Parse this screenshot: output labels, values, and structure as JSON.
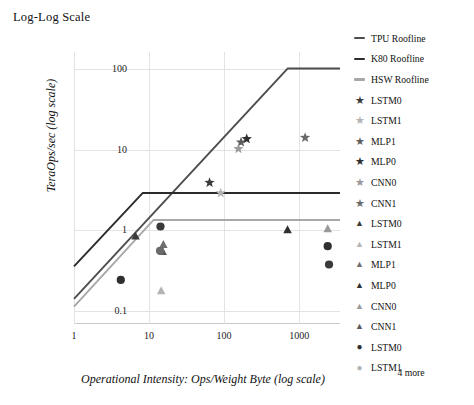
{
  "title": "Log-Log Scale",
  "legend": {
    "more_label": "4 more",
    "items": [
      {
        "label": "TPU Roofline",
        "marker": "line",
        "color": "#4d4d4d"
      },
      {
        "label": "K80 Roofline",
        "marker": "line",
        "color": "#2b2b2b"
      },
      {
        "label": "HSW Roofline",
        "marker": "line",
        "color": "#a8a8a8"
      },
      {
        "label": "LSTM0",
        "marker": "star",
        "color": "#3b3b3b"
      },
      {
        "label": "LSTM1",
        "marker": "star",
        "color": "#b4b4b4"
      },
      {
        "label": "MLP1",
        "marker": "star",
        "color": "#5e5e5e"
      },
      {
        "label": "MLP0",
        "marker": "star",
        "color": "#2f2f2f"
      },
      {
        "label": "CNN0",
        "marker": "star",
        "color": "#9a9a9a"
      },
      {
        "label": "CNN1",
        "marker": "star",
        "color": "#6b6b6b"
      },
      {
        "label": "LSTM0",
        "marker": "triangle",
        "color": "#3b3b3b"
      },
      {
        "label": "LSTM1",
        "marker": "triangle",
        "color": "#b4b4b4"
      },
      {
        "label": "MLP1",
        "marker": "triangle",
        "color": "#6f6f6f"
      },
      {
        "label": "MLP0",
        "marker": "triangle",
        "color": "#2f2f2f"
      },
      {
        "label": "CNN0",
        "marker": "triangle",
        "color": "#9a9a9a"
      },
      {
        "label": "CNN1",
        "marker": "triangle",
        "color": "#5a5a5a"
      },
      {
        "label": "LSTM0",
        "marker": "circle",
        "color": "#2f2f2f"
      },
      {
        "label": "LSTM1",
        "marker": "circle",
        "color": "#b4b4b4"
      }
    ]
  },
  "chart_data": {
    "type": "line",
    "title": "Log-Log Scale",
    "xlabel": "Operational Intensity: Ops/Weight Byte (log scale)",
    "ylabel": "TeraOps/sec (log scale)",
    "xscale": "log",
    "yscale": "log",
    "xlim": [
      1,
      3500
    ],
    "ylim": [
      0.07,
      160
    ],
    "xticks": [
      "1",
      "10",
      "100",
      "1000"
    ],
    "xtick_values": [
      1,
      10,
      100,
      1000
    ],
    "yticks": [
      "100",
      "10",
      "1",
      "0.1"
    ],
    "ytick_values": [
      100,
      10,
      1,
      0.1
    ],
    "grid": true,
    "legend_position": "right",
    "series": [
      {
        "name": "TPU Roofline",
        "color": "#4d4d4d",
        "points": [
          [
            1,
            0.143
          ],
          [
            700,
            100
          ],
          [
            3500,
            100
          ]
        ],
        "ridge_point": [
          700,
          100
        ],
        "peak": 100
      },
      {
        "name": "K80 Roofline",
        "color": "#2b2b2b",
        "points": [
          [
            1,
            0.36
          ],
          [
            8.2,
            2.9
          ],
          [
            3500,
            2.9
          ]
        ],
        "ridge_point": [
          8.2,
          2.9
        ],
        "peak": 2.9
      },
      {
        "name": "HSW Roofline",
        "color": "#a8a8a8",
        "points": [
          [
            1,
            0.115
          ],
          [
            11.5,
            1.35
          ],
          [
            3500,
            1.35
          ]
        ],
        "ridge_point": [
          11.5,
          1.35
        ],
        "peak": 1.35
      }
    ],
    "scatter": [
      {
        "name": "LSTM0",
        "marker": "star",
        "color": "#3b3b3b",
        "x": 64,
        "y": 3.9
      },
      {
        "name": "LSTM1",
        "marker": "star",
        "color": "#b4b4b4",
        "x": 90,
        "y": 2.9
      },
      {
        "name": "MLP1",
        "marker": "star",
        "color": "#5e5e5e",
        "x": 168,
        "y": 12.3
      },
      {
        "name": "MLP0",
        "marker": "star",
        "color": "#2f2f2f",
        "x": 200,
        "y": 13.5
      },
      {
        "name": "CNN0",
        "marker": "star",
        "color": "#9a9a9a",
        "x": 155,
        "y": 10.2
      },
      {
        "name": "CNN1",
        "marker": "star",
        "color": "#6b6b6b",
        "x": 1200,
        "y": 14.0
      },
      {
        "name": "LSTM0",
        "marker": "triangle",
        "color": "#3b3b3b",
        "x": 6.6,
        "y": 0.85
      },
      {
        "name": "LSTM1",
        "marker": "triangle",
        "color": "#b4b4b4",
        "x": 14.5,
        "y": 0.18
      },
      {
        "name": "MLP1",
        "marker": "triangle",
        "color": "#6f6f6f",
        "x": 15.5,
        "y": 0.67
      },
      {
        "name": "MLP0",
        "marker": "triangle",
        "color": "#2f2f2f",
        "x": 700,
        "y": 1.02
      },
      {
        "name": "CNN0",
        "marker": "triangle",
        "color": "#9a9a9a",
        "x": 2400,
        "y": 1.05
      },
      {
        "name": "CNN1",
        "marker": "triangle",
        "color": "#5a5a5a",
        "x": 15.2,
        "y": 0.55
      },
      {
        "name": "LSTM0",
        "marker": "circle",
        "color": "#2f2f2f",
        "x": 4.2,
        "y": 0.245
      },
      {
        "name": "LSTM1",
        "marker": "circle",
        "color": "#6a6a6a",
        "x": 14.0,
        "y": 0.56
      },
      {
        "name": "MLP0",
        "marker": "circle",
        "color": "#3a3a3a",
        "x": 14.2,
        "y": 1.12
      },
      {
        "name": "CNN0",
        "marker": "circle",
        "color": "#2f2f2f",
        "x": 2400,
        "y": 0.64
      },
      {
        "name": "CNN1",
        "marker": "circle",
        "color": "#3a3a3a",
        "x": 2500,
        "y": 0.38
      }
    ]
  }
}
